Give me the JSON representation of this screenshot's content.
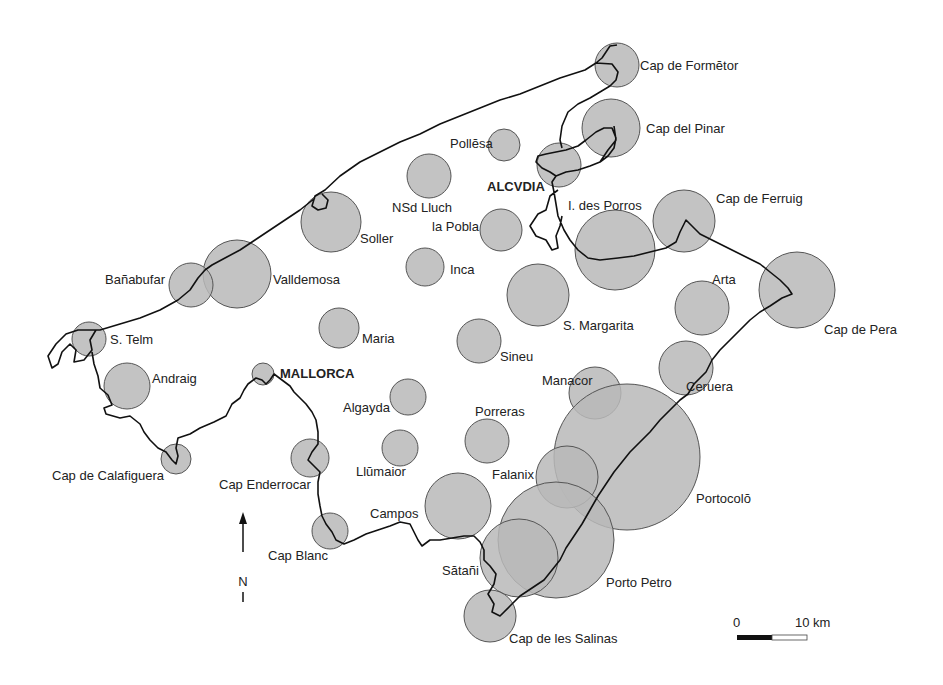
{
  "map": {
    "title": "Mallorca",
    "circle_fill": "#b8b8b8",
    "circle_stroke": "#555555",
    "coast_color": "#111111",
    "sites": [
      {
        "name": "Cap de Formĕtor",
        "cx": 617,
        "cy": 65,
        "r": 22,
        "lx": 640,
        "ly": 70
      },
      {
        "name": "Cap del Pinar",
        "cx": 611,
        "cy": 128,
        "r": 29,
        "lx": 646,
        "ly": 133
      },
      {
        "name": "Pollĕsa",
        "cx": 504,
        "cy": 145,
        "r": 16,
        "lx": 450,
        "ly": 148
      },
      {
        "name": "ALCVDIA",
        "cx": 559,
        "cy": 165,
        "r": 22,
        "lx": 487,
        "ly": 191,
        "bold": true
      },
      {
        "name": "NSd Lluch",
        "cx": 429,
        "cy": 176,
        "r": 22,
        "lx": 392,
        "ly": 212
      },
      {
        "name": "Soller",
        "cx": 331,
        "cy": 222,
        "r": 30,
        "lx": 360,
        "ly": 243
      },
      {
        "name": "la Pobla",
        "cx": 501,
        "cy": 230,
        "r": 21,
        "lx": 432,
        "ly": 231
      },
      {
        "name": "I. des Porros",
        "cx": 615,
        "cy": 250,
        "r": 40,
        "lx": 568,
        "ly": 210
      },
      {
        "name": "Cap de  Ferruig",
        "cx": 684,
        "cy": 221,
        "r": 31,
        "lx": 716,
        "ly": 203
      },
      {
        "name": "Inca",
        "cx": 425,
        "cy": 267,
        "r": 19,
        "lx": 450,
        "ly": 274
      },
      {
        "name": "Valldemosa",
        "cx": 237,
        "cy": 274,
        "r": 34,
        "lx": 273,
        "ly": 284
      },
      {
        "name": "Bañabufar",
        "cx": 191,
        "cy": 285,
        "r": 22,
        "lx": 105,
        "ly": 284
      },
      {
        "name": "S. Margarita",
        "cx": 538,
        "cy": 295,
        "r": 31,
        "lx": 563,
        "ly": 330
      },
      {
        "name": "Arta",
        "cx": 702,
        "cy": 308,
        "r": 27,
        "lx": 712,
        "ly": 284
      },
      {
        "name": "Cap de Pera",
        "cx": 797,
        "cy": 290,
        "r": 38,
        "lx": 824,
        "ly": 334
      },
      {
        "name": "S. Telm",
        "cx": 89,
        "cy": 339,
        "r": 17,
        "lx": 110,
        "ly": 344
      },
      {
        "name": "Maria",
        "cx": 339,
        "cy": 328,
        "r": 20,
        "lx": 362,
        "ly": 343
      },
      {
        "name": "Sineu",
        "cx": 479,
        "cy": 341,
        "r": 22,
        "lx": 500,
        "ly": 361
      },
      {
        "name": "MALLORCA",
        "cx": 263,
        "cy": 374,
        "r": 11,
        "lx": 280,
        "ly": 378,
        "bold": true
      },
      {
        "name": "Ceruera",
        "cx": 686,
        "cy": 368,
        "r": 27,
        "lx": 686,
        "ly": 391
      },
      {
        "name": "Andraig",
        "cx": 127,
        "cy": 386,
        "r": 23,
        "lx": 152,
        "ly": 383
      },
      {
        "name": "Manacor",
        "cx": 595,
        "cy": 393,
        "r": 26,
        "lx": 542,
        "ly": 385
      },
      {
        "name": "Algayda",
        "cx": 408,
        "cy": 397,
        "r": 18,
        "lx": 343,
        "ly": 412
      },
      {
        "name": "Portocolŏ",
        "cx": 627,
        "cy": 457,
        "r": 73,
        "lx": 696,
        "ly": 503
      },
      {
        "name": "Porreras",
        "cx": 487,
        "cy": 441,
        "r": 22,
        "lx": 475,
        "ly": 416
      },
      {
        "name": "Llŭmaior",
        "cx": 400,
        "cy": 448,
        "r": 18,
        "lx": 356,
        "ly": 476
      },
      {
        "name": "Cap Enderrocar",
        "cx": 310,
        "cy": 458,
        "r": 19,
        "lx": 219,
        "ly": 489
      },
      {
        "name": "Cap de Calafiguera",
        "cx": 176,
        "cy": 459,
        "r": 15,
        "lx": 52,
        "ly": 480
      },
      {
        "name": "Falanix",
        "cx": 567,
        "cy": 477,
        "r": 31,
        "lx": 492,
        "ly": 479
      },
      {
        "name": "Campos",
        "cx": 458,
        "cy": 506,
        "r": 33,
        "lx": 370,
        "ly": 518
      },
      {
        "name": "Porto Petro",
        "cx": 556,
        "cy": 540,
        "r": 58,
        "lx": 606,
        "ly": 587
      },
      {
        "name": "Cap Blanc",
        "cx": 330,
        "cy": 531,
        "r": 18,
        "lx": 268,
        "ly": 560
      },
      {
        "name": "Sătañi",
        "cx": 519,
        "cy": 558,
        "r": 39,
        "lx": 442,
        "ly": 575
      },
      {
        "name": "Cap de les Salinas",
        "cx": 490,
        "cy": 616,
        "r": 26,
        "lx": 509,
        "ly": 643
      }
    ]
  },
  "north_arrow": {
    "label": "N"
  },
  "scale_bar": {
    "start_label": "0",
    "end_label": "10 km"
  }
}
